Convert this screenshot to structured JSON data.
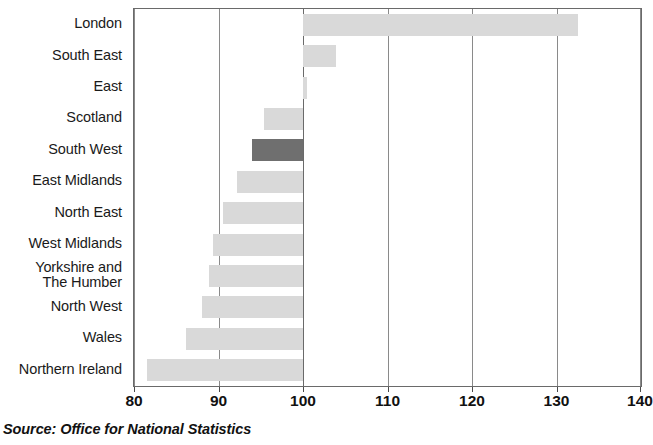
{
  "source_note": "Source: Office for National Statistics",
  "chart_data": {
    "type": "bar",
    "orientation": "horizontal",
    "title": "",
    "subtitle": "",
    "xlabel": "",
    "ylabel": "",
    "xlim": [
      80,
      140
    ],
    "baseline": 100,
    "grid": true,
    "gridlines_x": [
      80,
      90,
      100,
      110,
      120,
      130,
      140
    ],
    "xticks": [
      80,
      90,
      100,
      110,
      120,
      130,
      140
    ],
    "xticklabels": [
      "80",
      "90",
      "100",
      "110",
      "120",
      "130",
      "140"
    ],
    "legend": [],
    "bar_color": "#d9d9d9",
    "highlight_color": "#6f6f6f",
    "categories": [
      "London",
      "South East",
      "East",
      "Scotland",
      "South West",
      "East Midlands",
      "North East",
      "West Midlands",
      "Yorkshire and\nThe Humber",
      "North West",
      "Wales",
      "Northern Ireland"
    ],
    "values": [
      132.5,
      103.9,
      100.5,
      95.4,
      94.0,
      92.2,
      90.5,
      89.4,
      88.9,
      88.0,
      86.1,
      81.5
    ],
    "highlighted": [
      "South West"
    ]
  }
}
